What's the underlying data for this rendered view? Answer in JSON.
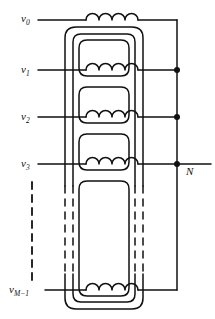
{
  "figure": {
    "type": "circuit-diagram",
    "width": 215,
    "height": 319,
    "line_color": "#111111",
    "background": "#ffffff"
  },
  "labels": {
    "v0": {
      "base": "v",
      "sub": "0",
      "x": 22,
      "y": 19
    },
    "v1": {
      "base": "v",
      "sub": "1",
      "x": 22,
      "y": 70
    },
    "v2": {
      "base": "v",
      "sub": "2",
      "x": 22,
      "y": 117
    },
    "v3": {
      "base": "v",
      "sub": "3",
      "x": 22,
      "y": 164
    },
    "vM1": {
      "base": "v",
      "sub": "M−1",
      "x": 12,
      "y": 293
    },
    "N": {
      "base": "N",
      "sub": "",
      "x": 188,
      "y": 171
    }
  },
  "windings": [
    {
      "name": "winding-v0",
      "label": "v0",
      "y": 20,
      "humps": 4,
      "terminal": "top"
    },
    {
      "name": "winding-v1",
      "label": "v1",
      "y": 70,
      "humps": 4,
      "terminal": "right-dot"
    },
    {
      "name": "winding-v2",
      "label": "v2",
      "y": 117,
      "humps": 4,
      "terminal": "right-dot"
    },
    {
      "name": "winding-v3",
      "label": "v3",
      "y": 164,
      "humps": 4,
      "terminal": "right-dot-neutral"
    },
    {
      "name": "winding-vM1",
      "label": "vM1",
      "y": 290,
      "humps": 4,
      "terminal": "bottom"
    }
  ],
  "junction_dots": [
    {
      "name": "junction-v1",
      "x": 177,
      "y": 70
    },
    {
      "name": "junction-v2",
      "x": 177,
      "y": 117
    },
    {
      "name": "junction-neutral-N",
      "x": 177,
      "y": 164
    }
  ],
  "core": {
    "name": "transformer-core",
    "outer": {
      "x": 65,
      "y": 27,
      "w": 78,
      "h": 282,
      "r": 11
    },
    "inner": {
      "x": 73,
      "y": 34,
      "w": 62,
      "h": 268,
      "r": 8
    },
    "dashed_break": {
      "y_start": 186,
      "y_end": 274
    }
  },
  "windows": [
    {
      "name": "core-window-1",
      "x": 79,
      "y": 40,
      "w": 50,
      "h": 36,
      "r": 8
    },
    {
      "name": "core-window-2",
      "x": 79,
      "y": 87,
      "w": 50,
      "h": 36,
      "r": 8
    },
    {
      "name": "core-window-3",
      "x": 79,
      "y": 134,
      "w": 50,
      "h": 36,
      "r": 8
    },
    {
      "name": "core-window-4",
      "x": 79,
      "y": 181,
      "w": 50,
      "h": 115,
      "r": 8
    }
  ],
  "neutral_bus": {
    "name": "neutral-bus",
    "x": 177,
    "y_top": 20,
    "y_bottom": 290
  },
  "dashed_continuation": {
    "name": "series-continuation-dashes",
    "x": 32,
    "y_top": 182,
    "y_bottom": 284
  }
}
